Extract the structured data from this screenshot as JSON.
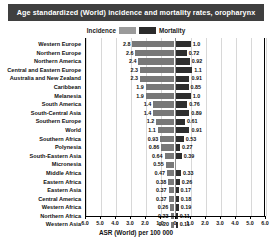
{
  "title": "Age standardized (World) incidence and mortality rates, oropharynx",
  "legend": {
    "incidence_label": "Incidence",
    "mortality_label": "Mortality",
    "incidence_color": "#787878",
    "mortality_color": "#2e2e2e"
  },
  "axis": {
    "x_title": "ASR (World) per 100 000",
    "tick_labels": [
      "6.0",
      "5.0",
      "4.0",
      "3.0",
      "2.0",
      "1.0",
      "0",
      "1.0",
      "2.0",
      "3.0",
      "4.0",
      "5.0",
      "6.0"
    ],
    "max": 6.0
  },
  "chart_data": {
    "type": "bar",
    "orientation": "horizontal-diverging",
    "title": "Age standardized (World) incidence and mortality rates, oropharynx",
    "xlabel": "ASR (World) per 100 000",
    "ylabel": "",
    "xlim": [
      -6.0,
      6.0
    ],
    "grid": true,
    "legend_position": "top-center",
    "categories": [
      "Western Europe",
      "Northern Europe",
      "Northern America",
      "Central and Eastern Europe",
      "Australia and New Zealand",
      "Caribbean",
      "Melanesia",
      "South America",
      "South-Central Asia",
      "Southern Europe",
      "World",
      "Southern Africa",
      "Polynesia",
      "South-Eastern Asia",
      "Micronesia",
      "Middle Africa",
      "Eastern Africa",
      "Eastern Asia",
      "Central America",
      "Western Africa",
      "Northern Africa",
      "Western Asia"
    ],
    "series": [
      {
        "name": "Incidence",
        "color": "#787878",
        "side": "left",
        "values": [
          2.8,
          2.6,
          2.4,
          2.3,
          2.3,
          1.9,
          1.9,
          1.4,
          1.4,
          1.2,
          1.1,
          0.93,
          0.86,
          0.64,
          0.55,
          0.47,
          0.38,
          0.37,
          0.37,
          0.26,
          0.23,
          0.2
        ]
      },
      {
        "name": "Mortality",
        "color": "#2e2e2e",
        "side": "right",
        "values": [
          1.0,
          0.72,
          0.92,
          1.1,
          0.91,
          0.85,
          1.0,
          0.76,
          0.89,
          0.61,
          0.91,
          0.53,
          0.27,
          0.39,
          null,
          0.33,
          0.26,
          0.17,
          0.18,
          0.19,
          0.11,
          0.11
        ]
      }
    ]
  }
}
